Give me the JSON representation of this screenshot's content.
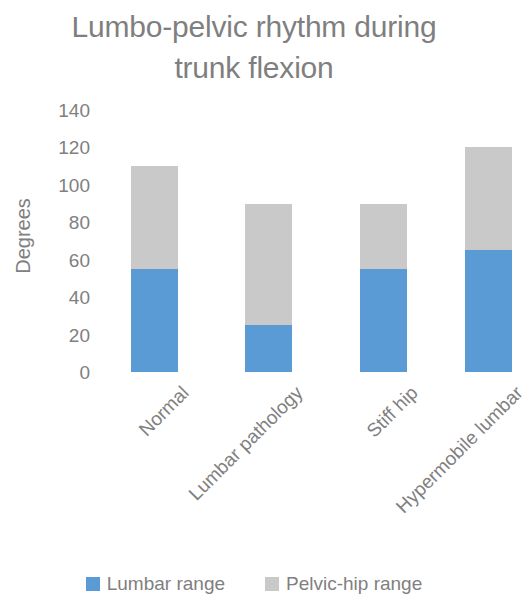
{
  "chart_data": {
    "type": "bar",
    "subtype": "stacked-column",
    "title": "Lumbo-pelvic rhythm during trunk flexion",
    "title_lines": [
      "Lumbo-pelvic rhythm during",
      "trunk flexion"
    ],
    "xlabel": "",
    "ylabel": "Degrees",
    "ylim": [
      0,
      140
    ],
    "ytick_step": 20,
    "yticks": [
      140,
      120,
      100,
      80,
      60,
      40,
      20,
      0
    ],
    "ytick_labels": [
      "140",
      "120",
      "100",
      "80",
      "60",
      "40",
      "20",
      "0"
    ],
    "grid": false,
    "legend_position": "bottom",
    "categories": [
      "Normal",
      "Lumbar pathology",
      "Stiff hip",
      "Hypermobile lumbar"
    ],
    "series": [
      {
        "name": "Lumbar range",
        "color": "#5b9bd5",
        "values": [
          55,
          25,
          55,
          65
        ]
      },
      {
        "name": "Pelvic-hip range",
        "color": "#c9c9c9",
        "values": [
          55,
          65,
          35,
          55
        ]
      }
    ],
    "totals": [
      110,
      90,
      90,
      120
    ],
    "note": "Last column is clipped by the right edge of the image"
  },
  "axis": {
    "y_title": "Degrees"
  },
  "legend": {
    "items": [
      {
        "label": "Lumbar range",
        "color": "#5b9bd5"
      },
      {
        "label": "Pelvic-hip range",
        "color": "#c9c9c9"
      }
    ]
  },
  "colors": {
    "lumbar": "#5b9bd5",
    "pelvic_hip": "#c9c9c9",
    "text": "#808080",
    "background": "#ffffff"
  }
}
